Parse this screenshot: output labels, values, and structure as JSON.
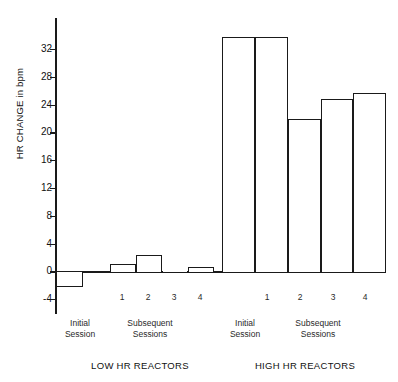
{
  "chart_data": {
    "type": "bar",
    "title": "",
    "xlabel": "",
    "ylabel": "HR CHANGE in bpm",
    "ylim": [
      -4,
      34
    ],
    "yticks": [
      -4,
      0,
      4,
      8,
      12,
      16,
      20,
      24,
      28,
      32
    ],
    "ytick_labels": [
      "-4",
      "0",
      "4",
      "8",
      "12",
      "16",
      "20",
      "24",
      "28",
      "32"
    ],
    "grid": false,
    "legend": "none",
    "panels": [
      {
        "name": "LOW HR REACTORS",
        "groups": [
          {
            "label": "Initial\nSession",
            "categories": [
              ""
            ],
            "values": [
              -2.2
            ]
          },
          {
            "label": "Subsequent\nSessions",
            "categories": [
              "1",
              "2",
              "3",
              "4"
            ],
            "values": [
              1.0,
              2.4,
              0.0,
              0.7
            ]
          }
        ]
      },
      {
        "name": "HIGH HR REACTORS",
        "groups": [
          {
            "label": "Initial\nSession",
            "categories": [
              ""
            ],
            "values": [
              33.7
            ]
          },
          {
            "label": "Subsequent\nSessions",
            "categories": [
              "1",
              "2",
              "3",
              "4"
            ],
            "values": [
              33.7,
              22.0,
              24.8,
              25.6
            ]
          }
        ]
      }
    ],
    "series": [
      {
        "name": "LOW HR REACTORS",
        "values": [
          -2.2,
          1.0,
          2.4,
          0.0,
          0.7
        ]
      },
      {
        "name": "HIGH HR REACTORS",
        "values": [
          33.7,
          33.7,
          22.0,
          24.8,
          25.6
        ]
      }
    ],
    "categories": [
      "Initial Session",
      "1",
      "2",
      "3",
      "4"
    ]
  },
  "axis": {
    "ylabel": "HR CHANGE in bpm",
    "ticks": [
      "32",
      "28",
      "24",
      "20",
      "16",
      "12",
      "8",
      "4",
      "0",
      "-4"
    ]
  },
  "low_panel": {
    "title": "LOW HR REACTORS",
    "initial_label": "Initial\nSession",
    "subsequent_label": "Subsequent\nSessions",
    "numbers": [
      "1",
      "2",
      "3",
      "4"
    ]
  },
  "high_panel": {
    "title": "HIGH HR REACTORS",
    "initial_label": "Initial\nSession",
    "subsequent_label": "Subsequent\nSessions",
    "numbers": [
      "1",
      "2",
      "3",
      "4"
    ]
  },
  "colors": {
    "ink": "#1a1a1a",
    "bar_fill": "#ffffff",
    "background": "#ffffff"
  }
}
